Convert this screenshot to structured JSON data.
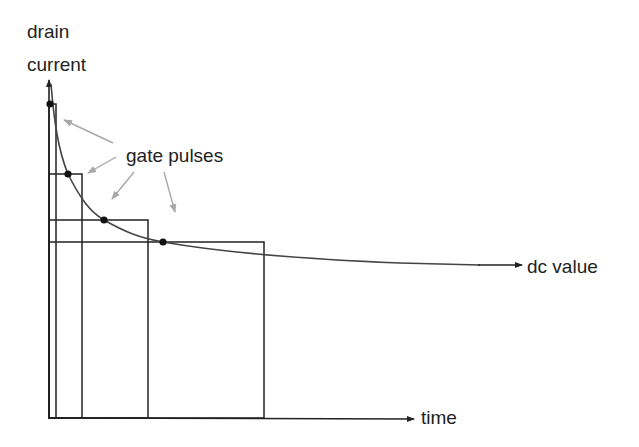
{
  "diagram": {
    "y_axis_label_line1": "drain",
    "y_axis_label_line2": "current",
    "x_axis_label": "time",
    "callout_label": "gate pulses",
    "asymptote_label": "dc value",
    "colors": {
      "line": "#222222",
      "curve": "#444444",
      "callout_arrow": "#a8a8a8",
      "background": "#ffffff"
    },
    "pulses": [
      {
        "index": 1,
        "width_rank": "shortest",
        "dot_on_curve": true
      },
      {
        "index": 2,
        "width_rank": "short",
        "dot_on_curve": true
      },
      {
        "index": 3,
        "width_rank": "medium",
        "dot_on_curve": true
      },
      {
        "index": 4,
        "width_rank": "longest",
        "dot_on_curve": true
      }
    ]
  }
}
